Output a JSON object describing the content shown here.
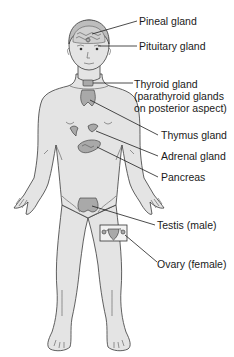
{
  "diagram": {
    "labels": {
      "pineal": "Pineal gland",
      "pituitary": "Pituitary gland",
      "thyroid_line1": "Thyroid gland",
      "thyroid_line2": "(parathyroid glands",
      "thyroid_line3": "on posterior aspect)",
      "thymus": "Thymus gland",
      "adrenal": "Adrenal gland",
      "pancreas": "Pancreas",
      "testis": "Testis (male)",
      "ovary": "Ovary (female)"
    },
    "colors": {
      "skin": "#e4e4e4",
      "outline": "#3a3a3a",
      "organ": "#a9a9a9",
      "text": "#1a1a1a"
    }
  }
}
